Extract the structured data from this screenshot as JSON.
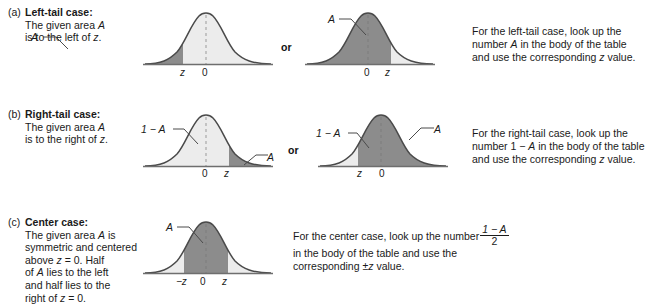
{
  "figure": {
    "type": "statistics-diagram"
  },
  "rows": {
    "a": {
      "tag": "(a)",
      "heading": "Left-tail case:",
      "desc_line1": "The given area A",
      "desc_line2": "is to the left of z.",
      "or_label": "or",
      "chart1": {
        "area_label": "A",
        "axis_labels": [
          "z",
          "0"
        ],
        "shade_dark": "left of z",
        "shade_light": "right of z"
      },
      "chart2": {
        "area_label": "A",
        "axis_labels": [
          "0",
          "z"
        ],
        "shade_dark": "left of z",
        "shade_light": "right of z"
      },
      "instruction_line1": "For the left-tail case, look up the",
      "instruction_line2": "number A in the body of the table",
      "instruction_line3": "and use the corresponding z value."
    },
    "b": {
      "tag": "(b)",
      "heading": "Right-tail case:",
      "desc_line1": "The given area A",
      "desc_line2": "is to the right of z.",
      "or_label": "or",
      "chart1": {
        "left_label": "1 − A",
        "area_label": "A",
        "axis_labels": [
          "0",
          "z"
        ],
        "shade_light": "left of z",
        "shade_dark": "right of z"
      },
      "chart2": {
        "left_label": "1 − A",
        "area_label": "A",
        "axis_labels": [
          "z",
          "0"
        ],
        "shade_light": "left of z",
        "shade_dark": "right of z"
      },
      "instruction_line1": "For the right-tail case, look up the",
      "instruction_line2": "number 1 − A in the body of the table",
      "instruction_line3": "and use the corresponding z value."
    },
    "c": {
      "tag": "(c)",
      "heading": "Center case:",
      "desc_line1": "The given area A is",
      "desc_line2": "symmetric and centered",
      "desc_line3": "above z = 0. Half",
      "desc_line4": "of A lies to the left",
      "desc_line5": "and half lies to the",
      "desc_line6": "right of z = 0.",
      "chart1": {
        "area_label": "A",
        "axis_labels": [
          "−z",
          "0",
          "z"
        ],
        "shade_dark": "between -z and z",
        "shade_light": "outside -z and z"
      },
      "instruction_pre": "For the center case, look up the number",
      "fraction_numerator": "1 − A",
      "fraction_denominator": "2",
      "instruction_line2": "in the body of the table and use the",
      "instruction_line3": "corresponding ±z value."
    }
  },
  "colors": {
    "dark_shade": "#8c8c8c",
    "light_shade": "#ececec",
    "curve_stroke": "#4a4a4a",
    "axis": "#6e6e6e",
    "text": "#1a1a1a"
  },
  "chart_data": {
    "type": "area",
    "distribution": "standard normal (mean 0, sd 1)",
    "panels": [
      {
        "panel": "a1",
        "case": "left-tail",
        "shaded_region": {
          "from": "-infinity",
          "to": "z",
          "shade": "dark",
          "label": "A"
        },
        "unshaded_region": {
          "from": "z",
          "to": "+infinity",
          "shade": "light"
        },
        "z_position": -0.75,
        "ticks": [
          "z",
          "0"
        ]
      },
      {
        "panel": "a2",
        "case": "left-tail",
        "shaded_region": {
          "from": "-infinity",
          "to": "z",
          "shade": "dark",
          "label": "A"
        },
        "unshaded_region": {
          "from": "z",
          "to": "+infinity",
          "shade": "light"
        },
        "z_position": 0.75,
        "ticks": [
          "0",
          "z"
        ]
      },
      {
        "panel": "b1",
        "case": "right-tail",
        "shaded_region": {
          "from": "z",
          "to": "+infinity",
          "shade": "dark",
          "label": "A"
        },
        "unshaded_region": {
          "from": "-infinity",
          "to": "z",
          "shade": "light",
          "label": "1 - A"
        },
        "z_position": 0.75,
        "ticks": [
          "0",
          "z"
        ]
      },
      {
        "panel": "b2",
        "case": "right-tail",
        "shaded_region": {
          "from": "z",
          "to": "+infinity",
          "shade": "dark",
          "label": "A"
        },
        "unshaded_region": {
          "from": "-infinity",
          "to": "z",
          "shade": "light",
          "label": "1 - A"
        },
        "z_position": -0.75,
        "ticks": [
          "z",
          "0"
        ]
      },
      {
        "panel": "c1",
        "case": "center",
        "shaded_region": {
          "from": "-z",
          "to": "z",
          "shade": "dark",
          "label": "A"
        },
        "unshaded_region": {
          "from": "outside",
          "to": "tails",
          "shade": "light"
        },
        "z_position": 0.85,
        "ticks": [
          "-z",
          "0",
          "z"
        ]
      }
    ]
  }
}
